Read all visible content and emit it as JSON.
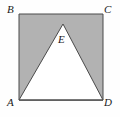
{
  "figure": {
    "type": "geometry-diagram",
    "background_color": "#fefefe",
    "shaded_fill_color": "#b2b2b2",
    "unshaded_fill_color": "#ffffff",
    "stroke_color": "#4a4a4a",
    "stroke_width": 1,
    "shapes": [
      {
        "name": "square-ABCD",
        "kind": "square",
        "fill": "#b2b2b2",
        "vertices": [
          {
            "label": "B",
            "x": 19,
            "y": 14
          },
          {
            "label": "C",
            "x": 103,
            "y": 14
          },
          {
            "label": "D",
            "x": 103,
            "y": 100
          },
          {
            "label": "A",
            "x": 19,
            "y": 100
          }
        ]
      },
      {
        "name": "triangle-AED",
        "kind": "triangle",
        "fill": "#ffffff",
        "vertices": [
          {
            "label": "A",
            "x": 19,
            "y": 100
          },
          {
            "label": "E",
            "x": 63,
            "y": 24
          },
          {
            "label": "D",
            "x": 103,
            "y": 100
          }
        ]
      }
    ],
    "labels": [
      {
        "id": "B",
        "text": "B",
        "position": "top-left",
        "x": 7,
        "y": 4
      },
      {
        "id": "C",
        "text": "C",
        "position": "top-right",
        "x": 104,
        "y": 4
      },
      {
        "id": "A",
        "text": "A",
        "position": "bottom-left",
        "x": 7,
        "y": 97
      },
      {
        "id": "D",
        "text": "D",
        "position": "bottom-right",
        "x": 104,
        "y": 97
      },
      {
        "id": "E",
        "text": "E",
        "position": "apex-interior",
        "x": 58,
        "y": 34
      }
    ]
  }
}
